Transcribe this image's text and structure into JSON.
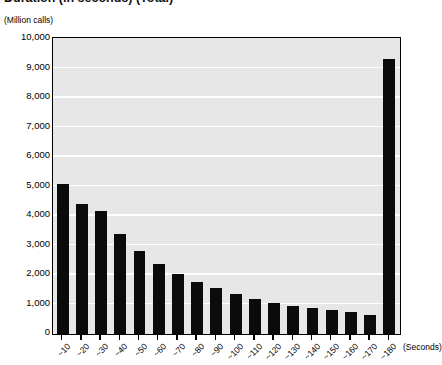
{
  "title": "Duration (in seconds) (Total)",
  "y_unit_label": "(Million calls)",
  "x_axis_title": "(Seconds)",
  "chart_data": {
    "type": "bar",
    "title": "Duration (in seconds) (Total)",
    "xlabel": "(Seconds)",
    "ylabel": "(Million calls)",
    "ylim": [
      0,
      10000
    ],
    "ytick_labels": [
      "10,000",
      "9,000",
      "8,000",
      "7,000",
      "6,000",
      "5,000",
      "4,000",
      "3,000",
      "2,000",
      "1,000",
      "0"
    ],
    "ytick_values": [
      10000,
      9000,
      8000,
      7000,
      6000,
      5000,
      4000,
      3000,
      2000,
      1000,
      0
    ],
    "grid": true,
    "legend": "none",
    "categories": [
      "~10",
      "~20",
      "~30",
      "~40",
      "~50",
      "~60",
      "~70",
      "~80",
      "~90",
      "~100",
      "~110",
      "~120",
      "~130",
      "~140",
      "~150",
      "~160",
      "~170",
      "~180"
    ],
    "values": [
      5070,
      4400,
      4170,
      3400,
      2830,
      2370,
      2050,
      1780,
      1560,
      1360,
      1180,
      1060,
      960,
      880,
      800,
      730,
      650,
      9330
    ],
    "bar_color": "#0b0b0b",
    "plot_background": "#e7e7e7",
    "gridline_color": "#ffffff"
  }
}
